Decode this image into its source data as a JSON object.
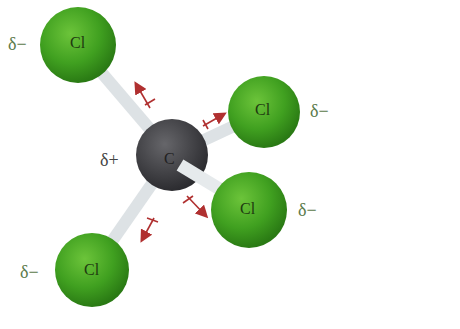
{
  "diagram": {
    "title": "",
    "center_atom": {
      "symbol": "C",
      "charge": "δ+"
    },
    "atoms": [
      {
        "symbol": "Cl",
        "charge": "δ−",
        "position": "top-left"
      },
      {
        "symbol": "Cl",
        "charge": "δ−",
        "position": "right-upper"
      },
      {
        "symbol": "Cl",
        "charge": "δ−",
        "position": "right-lower"
      },
      {
        "symbol": "Cl",
        "charge": "δ−",
        "position": "bottom-left"
      }
    ],
    "colors": {
      "chlorine": "#3f9a1e",
      "carbon": "#444446",
      "bond": "#e8ecee",
      "dipole_arrow": "#b03030",
      "charge_text": "#5a7a4a"
    }
  }
}
